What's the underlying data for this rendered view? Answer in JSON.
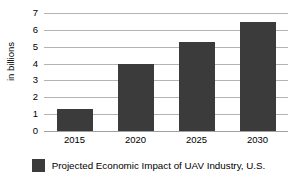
{
  "chart_data": {
    "type": "bar",
    "title": "",
    "subtitle": "",
    "xlabel": "",
    "ylabel": "in billions",
    "categories": [
      "2015",
      "2020",
      "2025",
      "2030"
    ],
    "values": [
      1.3,
      4.0,
      5.3,
      6.45
    ],
    "series": [
      {
        "name": "Projected Economic Impact of UAV Industry, U.S.",
        "values": [
          1.3,
          4.0,
          5.3,
          6.45
        ],
        "color": "#3b3b3b"
      }
    ],
    "ylim": [
      0,
      7
    ],
    "y_ticks": [
      "0",
      "1",
      "2",
      "3",
      "4",
      "5",
      "6",
      "7"
    ],
    "y_tick_values": [
      0,
      1,
      2,
      3,
      4,
      5,
      6,
      7
    ],
    "grid": true,
    "grid_axis": "y",
    "grid_color": "#b4b4b4",
    "legend": {
      "position": "bottom",
      "entries": [
        {
          "label": "Projected Economic Impact of UAV Industry, U.S.",
          "color": "#3b3b3b",
          "swatch": "legend-swatch-square"
        }
      ]
    },
    "background_color": "#ffffff",
    "bar_color": "#3b3b3b"
  }
}
